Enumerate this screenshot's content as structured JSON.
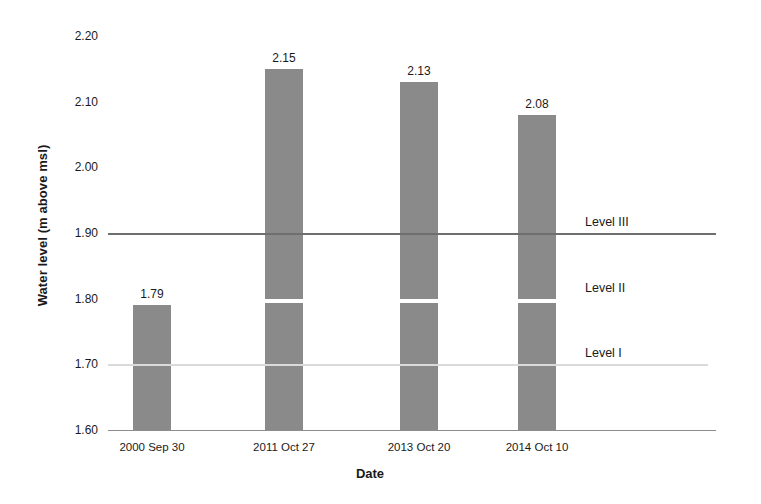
{
  "chart_data": {
    "type": "bar",
    "title": "",
    "xlabel": "Date",
    "ylabel": "Water level (m above msl)",
    "categories": [
      "2000 Sep 30",
      "2011 Oct 27",
      "2013 Oct 20",
      "2014 Oct 10"
    ],
    "values": [
      1.79,
      2.15,
      2.13,
      2.08
    ],
    "value_labels": [
      "1.79",
      "2.15",
      "2.13",
      "2.08"
    ],
    "ylim": [
      1.6,
      2.2
    ],
    "ytick_labels": [
      "2.20",
      "2.10",
      "2.00",
      "1.90",
      "1.80",
      "1.70",
      "1.60"
    ],
    "ytick_values": [
      2.2,
      2.1,
      2.0,
      1.9,
      1.8,
      1.7,
      1.6
    ],
    "grid": false,
    "legend": "none",
    "bar_color": "#8a8a8a",
    "annotations": [
      {
        "label": "Level III",
        "value": 1.9,
        "line_color": "#6e6e6e"
      },
      {
        "label": "Level II",
        "value": 1.8,
        "line_color": "#ffffff"
      },
      {
        "label": "Level I",
        "value": 1.7,
        "line_color": "#dadada"
      }
    ]
  },
  "axis": {
    "y_title": "Water level (m above msl)",
    "x_title": "Date"
  }
}
